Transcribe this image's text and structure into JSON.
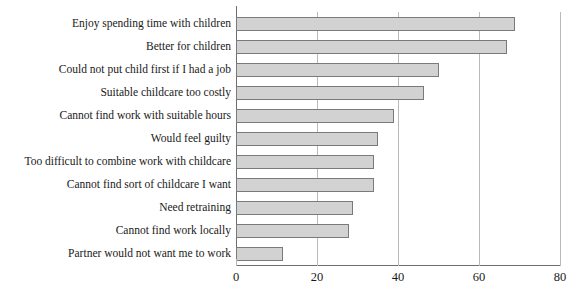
{
  "chart_data": {
    "type": "bar",
    "orientation": "horizontal",
    "title": "",
    "subtitle": "",
    "xlabel": "",
    "ylabel": "",
    "xlim": [
      0,
      80
    ],
    "xticks": [
      0,
      20,
      40,
      60,
      80
    ],
    "grid": "vertical",
    "legend": "none",
    "bar_color": "#d2d2d2",
    "bar_border_color": "#7a7a7a",
    "axis_color": "#6e6e6e",
    "gridline_color": "#b9b9b9",
    "categories": [
      "Enjoy spending time with children",
      "Better for children",
      "Could not put child first if I had a job",
      "Suitable childcare too costly",
      "Cannot find work with suitable hours",
      "Would feel guilty",
      "Too difficult to combine work with childcare",
      "Cannot find sort of childcare I want",
      "Need retraining",
      "Cannot find work locally",
      "Partner would not want me to work"
    ],
    "values": [
      69,
      67,
      50,
      46.5,
      39,
      35,
      34,
      34,
      29,
      28,
      11.5
    ]
  }
}
